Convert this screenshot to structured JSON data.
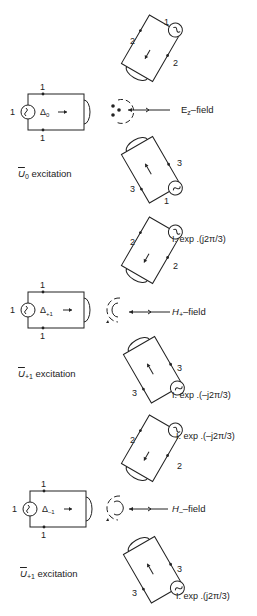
{
  "diagram": {
    "type": "three-port symmetric junction excitation diagrams",
    "panels": [
      {
        "id": "u0",
        "caption": {
          "symbol": "U",
          "subscript": "0",
          "text": "excitation"
        },
        "field_label": {
          "main": "E",
          "subscript": "z",
          "suffix": "–field"
        },
        "field_symbol": "three dots (E-field pattern) with circulating arrows",
        "port1": {
          "label": "1",
          "terminal_top": "1",
          "terminal_bottom": "1",
          "source_label": "Δ₀"
        },
        "port2": {
          "label": "1",
          "terminal_a": "2",
          "terminal_b": "2",
          "amplitude": ""
        },
        "port3": {
          "label": "1",
          "terminal_a": "3",
          "terminal_b": "3",
          "amplitude": ""
        }
      },
      {
        "id": "u_plus1",
        "caption": {
          "symbol": "U",
          "subscript": "+1",
          "text": "excitation"
        },
        "field_label": {
          "main": "H",
          "subscript": "+",
          "suffix": "–field"
        },
        "field_symbol": "inner arc with circulating arrows",
        "port1": {
          "label": "1",
          "terminal_top": "1",
          "terminal_bottom": "1",
          "source_label": "Δ₊₁"
        },
        "port2": {
          "terminal_a": "2",
          "terminal_b": "2",
          "amplitude": "I. exp .(j2π/3)"
        },
        "port3": {
          "terminal_a": "3",
          "terminal_b": "3",
          "amplitude": "I. exp .(–j2π/3)"
        }
      },
      {
        "id": "u_minus1",
        "caption": {
          "symbol": "U",
          "subscript": "+1",
          "text": "excitation"
        },
        "field_label": {
          "main": "H",
          "subscript": "–",
          "suffix": "–field"
        },
        "field_symbol": "inner arc with circulating arrows",
        "port1": {
          "label": "1",
          "terminal_top": "1",
          "terminal_bottom": "1",
          "source_label": "Δ₋₁"
        },
        "port2": {
          "terminal_a": "2",
          "terminal_b": "2",
          "amplitude": "I. exp .(–j2π/3)"
        },
        "port3": {
          "terminal_a": "3",
          "terminal_b": "3",
          "amplitude": "I. exp .(j2π/3)"
        }
      }
    ]
  },
  "text": {
    "p0": {
      "cap_sym": "U",
      "cap_sub": "0",
      "cap_text": " excitation",
      "field_main": "E",
      "field_sub": "z",
      "field_suffix": "–field",
      "n1": "1",
      "t1a": "1",
      "t1b": "1",
      "t2a": "2",
      "t2b": "2",
      "t2top": "1",
      "t3a": "3",
      "t3b": "3",
      "t3bot": "1",
      "src": "Δ",
      "src_sub": "0"
    },
    "p1": {
      "cap_sym": "U",
      "cap_sub": "+1",
      "cap_text": " excitation",
      "field_main": "H",
      "field_sub": "+",
      "field_suffix": "–field",
      "n1": "1",
      "t1a": "1",
      "t1b": "1",
      "t2a": "2",
      "t2b": "2",
      "t3a": "3",
      "t3b": "3",
      "amp2": "I. exp .(j2π/3)",
      "amp3": "I. exp .(–j2π/3)",
      "src": "Δ",
      "src_sub": "+1"
    },
    "p2": {
      "cap_sym": "U",
      "cap_sub": "+1",
      "cap_text": " excitation",
      "field_main": "H",
      "field_sub": "–",
      "field_suffix": "–field",
      "n1": "1",
      "t1a": "1",
      "t1b": "1",
      "t2a": "2",
      "t2b": "2",
      "t3a": "3",
      "t3b": "3",
      "amp2": "I. exp .(–j2π/3)",
      "amp3": "I. exp .(j2π/3)",
      "src": "Δ",
      "src_sub": "–1"
    }
  },
  "colors": {
    "ink": "#222222",
    "background": "#ffffff"
  }
}
